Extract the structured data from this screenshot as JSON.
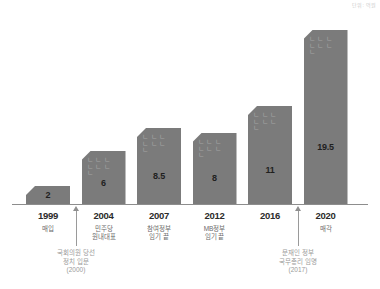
{
  "unit_note": "단위: 억원",
  "chart_data": {
    "type": "bar",
    "title": "",
    "xlabel": "",
    "ylabel": "",
    "unit": "억원",
    "ylim": [
      0,
      22
    ],
    "grid": false,
    "legend": "none",
    "categories": [
      "1999",
      "2004",
      "2007",
      "2012",
      "2016",
      "2020"
    ],
    "values": [
      2,
      6,
      8.5,
      8,
      11,
      19.5
    ],
    "value_labels": [
      "2",
      "6",
      "8.5",
      "8",
      "11",
      "19.5"
    ],
    "category_sublabels": [
      "매입",
      "민주당\n원내대표",
      "참여정부\n임기 끝",
      "MB정부\n임기 끝",
      "",
      "매각"
    ],
    "bar_color": "#7b7b7b",
    "axis_color": "#8d8d8d",
    "annotations": [
      {
        "after_category": "1999",
        "text": "국회의원 당선\n정치 입문\n(2000)"
      },
      {
        "after_category": "2016",
        "text": "문재인 정부\n국무총리 임명\n(2017)"
      }
    ],
    "bar_texture_glyphs": "ㄴㄴㄴㄴㄴㄴㄴ"
  }
}
